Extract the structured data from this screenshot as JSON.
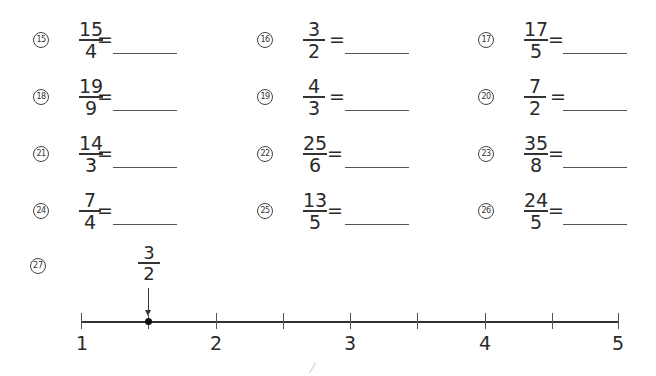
{
  "problems": [
    {
      "number": "15",
      "numerator": "15",
      "denominator": "4",
      "equals": "="
    },
    {
      "number": "16",
      "numerator": "3",
      "denominator": "2",
      "equals": "="
    },
    {
      "number": "17",
      "numerator": "17",
      "denominator": "5",
      "equals": "="
    },
    {
      "number": "18",
      "numerator": "19",
      "denominator": "9",
      "equals": "="
    },
    {
      "number": "19",
      "numerator": "4",
      "denominator": "3",
      "equals": "="
    },
    {
      "number": "20",
      "numerator": "7",
      "denominator": "2",
      "equals": "="
    },
    {
      "number": "21",
      "numerator": "14",
      "denominator": "3",
      "equals": "="
    },
    {
      "number": "22",
      "numerator": "25",
      "denominator": "6",
      "equals": "="
    },
    {
      "number": "23",
      "numerator": "35",
      "denominator": "8",
      "equals": "="
    },
    {
      "number": "24",
      "numerator": "7",
      "denominator": "4",
      "equals": "="
    },
    {
      "number": "25",
      "numerator": "13",
      "denominator": "5",
      "equals": "="
    },
    {
      "number": "26",
      "numerator": "24",
      "denominator": "5",
      "equals": "="
    }
  ],
  "number_line": {
    "number": "27",
    "marker": {
      "numerator": "3",
      "denominator": "2"
    },
    "labels": [
      "1",
      "2",
      "3",
      "4",
      "5"
    ]
  }
}
